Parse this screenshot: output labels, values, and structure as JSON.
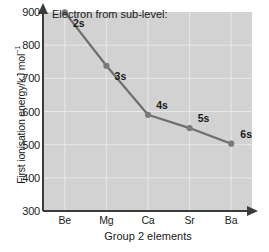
{
  "chart_data": {
    "type": "line",
    "title": "",
    "legend_caption": "Electron from sub-level:",
    "legend_position": "inside-top-left",
    "grid": true,
    "categories": [
      "Be",
      "Mg",
      "Ca",
      "Sr",
      "Ba"
    ],
    "values": [
      899,
      738,
      590,
      550,
      503
    ],
    "point_labels": [
      "2s",
      "3s",
      "4s",
      "5s",
      "6s"
    ],
    "xlabel": "Group 2 elements",
    "ylabel_text": "First ionisation energy/kJ mol",
    "ylabel_sup": "−1",
    "ylim": [
      300,
      900
    ],
    "yticks": [
      300,
      400,
      500,
      600,
      700,
      800,
      900
    ],
    "ytick_labels": [
      "300",
      "400",
      "500",
      "600",
      "700",
      "800",
      "900"
    ],
    "colors": {
      "plot_background": "#d2d2d2",
      "gridline": "#e8e8e8",
      "series_line": "#6e6e6e",
      "marker": "#7a7a7a",
      "axis": "#3b3b3b",
      "text": "#1a1a1a",
      "page_background": "#ffffff"
    }
  }
}
